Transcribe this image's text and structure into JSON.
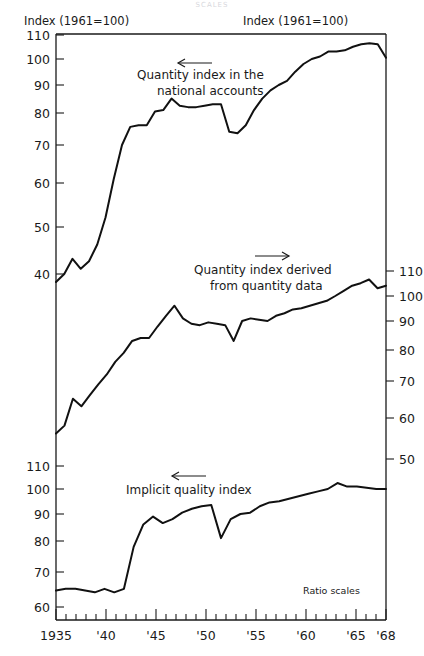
{
  "page": {
    "faint_header": "SCALES"
  },
  "labels": {
    "left_axis_title": "Index (1961=100)",
    "right_axis_title": "Index  (1961=100)",
    "ratio_note": "Ratio scales"
  },
  "annotations": [
    {
      "name": "annotation-top",
      "lines": [
        "Quantity index in the",
        "national accounts"
      ],
      "arrow": "left"
    },
    {
      "name": "annotation-middle",
      "lines": [
        "Quantity index derived",
        "from quantity data"
      ],
      "arrow": "right"
    },
    {
      "name": "annotation-bottom",
      "lines": [
        "Implicit quality index"
      ],
      "arrow": "left"
    }
  ],
  "chart_data": {
    "type": "line",
    "title": "",
    "subtitle": "",
    "xlabel": "",
    "ylabel": "Index (1961=100)",
    "grid": false,
    "legend": "annotations-inline",
    "scale": "logarithmic (ratio scales)",
    "x": [
      1935,
      1936,
      1937,
      1938,
      1939,
      1940,
      1941,
      1942,
      1943,
      1944,
      1945,
      1946,
      1947,
      1948,
      1949,
      1950,
      1951,
      1952,
      1953,
      1954,
      1955,
      1956,
      1957,
      1958,
      1959,
      1960,
      1961,
      1962,
      1963,
      1964,
      1965,
      1966,
      1967,
      1968
    ],
    "xtick_labels": [
      "1935",
      "'40",
      "'45",
      "'50",
      "'55",
      "'60",
      "'65",
      "'68"
    ],
    "xtick_values": [
      1935,
      1940,
      1945,
      1950,
      1955,
      1960,
      1965,
      1968
    ],
    "panels": [
      {
        "name": "quantity-index-national-accounts",
        "axis_side": "left",
        "ytick_values": [
          110,
          100,
          90,
          80,
          70,
          60,
          50,
          40
        ],
        "ylim": [
          36,
          113
        ],
        "values": [
          38.5,
          40.0,
          43.0,
          41.0,
          42.5,
          46.0,
          52.0,
          61.0,
          70.0,
          75.5,
          76.0,
          76.0,
          80.5,
          81.0,
          85.0,
          82.5,
          82.0,
          82.0,
          82.5,
          83.0,
          83.0,
          74.0,
          73.5,
          76.0,
          81.0,
          85.0,
          88.0,
          90.0,
          91.5,
          95.0,
          98.0,
          100.0,
          101.0,
          103.0,
          103.0,
          103.5,
          105.0,
          106.0,
          106.5,
          106.0,
          100.5
        ]
      },
      {
        "name": "quantity-index-derived-from-quantity-data",
        "axis_side": "right",
        "ytick_values": [
          110,
          100,
          90,
          80,
          70,
          60,
          50
        ],
        "ylim": [
          44,
          118
        ],
        "values": [
          56.0,
          58.0,
          65.0,
          63.0,
          66.0,
          69.0,
          72.0,
          76.0,
          79.0,
          83.0,
          84.0,
          84.0,
          88.0,
          92.0,
          96.0,
          91.0,
          89.0,
          88.5,
          89.5,
          89.0,
          88.5,
          83.0,
          90.0,
          91.0,
          90.5,
          90.0,
          92.0,
          93.0,
          94.5,
          95.0,
          96.0,
          97.0,
          98.0,
          100.0,
          102.0,
          104.0,
          105.0,
          106.5,
          103.0,
          104.0
        ]
      },
      {
        "name": "implicit-quality-index",
        "axis_side": "left",
        "ytick_values": [
          110,
          100,
          90,
          80,
          70,
          60
        ],
        "ylim": [
          55,
          115
        ],
        "values": [
          64.5,
          65.0,
          65.0,
          64.5,
          64.0,
          65.0,
          64.0,
          65.0,
          78.0,
          86.0,
          89.0,
          86.5,
          88.0,
          90.5,
          92.0,
          93.0,
          93.5,
          81.0,
          88.0,
          90.0,
          90.5,
          93.0,
          94.5,
          95.0,
          96.0,
          97.0,
          98.0,
          99.0,
          100.0,
          102.5,
          101.0,
          101.0,
          100.5,
          100.0,
          100.0
        ]
      }
    ]
  },
  "colors": {
    "ink": "#111111",
    "background": "#ffffff",
    "faint": "#d8d8dd"
  }
}
